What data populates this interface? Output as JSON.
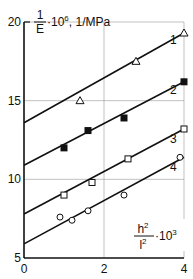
{
  "chart_data": {
    "type": "line",
    "title": "",
    "ylabel": {
      "fraction_num": "1",
      "fraction_den": "E",
      "suffix": "·10",
      "exp": "6",
      "unit": ", 1/MPa"
    },
    "xlabel": {
      "num": "h",
      "num_exp": "2",
      "den": "l",
      "den_exp": "2",
      "suffix": "·10",
      "exp": "3"
    },
    "xlim": [
      0,
      4
    ],
    "ylim": [
      5,
      20
    ],
    "x_ticks": [
      0,
      2,
      4
    ],
    "y_ticks": [
      5,
      10,
      15,
      20
    ],
    "grid": true,
    "series": [
      {
        "name": "1",
        "marker": "open-triangle",
        "line": [
          [
            0,
            13.6
          ],
          [
            4,
            19.3
          ]
        ],
        "points": [
          [
            1.4,
            15.0
          ],
          [
            2.8,
            17.5
          ],
          [
            4.0,
            19.3
          ]
        ],
        "label_at": [
          3.3,
          18.6
        ]
      },
      {
        "name": "2",
        "marker": "filled-square",
        "line": [
          [
            0,
            10.9
          ],
          [
            4,
            16.2
          ]
        ],
        "points": [
          [
            1.0,
            12.0
          ],
          [
            1.6,
            13.1
          ],
          [
            2.5,
            13.9
          ],
          [
            4.0,
            16.2
          ]
        ],
        "label_at": [
          3.3,
          15.4
        ]
      },
      {
        "name": "3",
        "marker": "open-square",
        "line": [
          [
            0,
            7.8
          ],
          [
            4,
            13.2
          ]
        ],
        "points": [
          [
            1.0,
            9.0
          ],
          [
            1.7,
            9.8
          ],
          [
            2.6,
            11.3
          ],
          [
            4.0,
            13.2
          ]
        ],
        "label_at": [
          3.3,
          12.3
        ]
      },
      {
        "name": "4",
        "marker": "open-circle",
        "line": [
          [
            0,
            5.9
          ],
          [
            4,
            11.4
          ]
        ],
        "points": [
          [
            0.9,
            7.6
          ],
          [
            1.2,
            7.4
          ],
          [
            1.6,
            8.0
          ],
          [
            2.5,
            9.0
          ],
          [
            3.9,
            11.4
          ]
        ],
        "label_at": [
          3.3,
          10.5
        ]
      }
    ]
  }
}
